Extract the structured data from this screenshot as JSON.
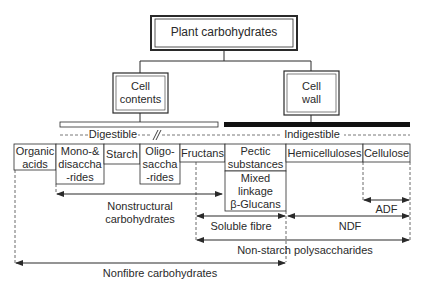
{
  "title": "Plant carbohydrates",
  "level2": {
    "cell_contents": [
      "Cell",
      "contents"
    ],
    "cell_wall": [
      "Cell",
      "wall"
    ]
  },
  "digestibility": {
    "digestible": "Digestible",
    "indigestible": "Indigestible"
  },
  "components": [
    {
      "id": "organic-acids",
      "lines": [
        "Organic",
        "acids"
      ]
    },
    {
      "id": "mono-disaccharides",
      "lines": [
        "Mono-&",
        "disaccha",
        "-rides"
      ]
    },
    {
      "id": "starch",
      "lines": [
        "Starch"
      ]
    },
    {
      "id": "oligosaccharides",
      "lines": [
        "Oligo-",
        "saccha",
        "-rides"
      ]
    },
    {
      "id": "fructans",
      "lines": [
        "Fructans"
      ]
    },
    {
      "id": "pectic-substances",
      "lines": [
        "Pectic",
        "substances"
      ]
    },
    {
      "id": "mixed-linkage-beta-glucans",
      "lines": [
        "Mixed",
        "linkage",
        "β-Glucans"
      ]
    },
    {
      "id": "hemicelluloses",
      "lines": [
        "Hemicelluloses"
      ]
    },
    {
      "id": "cellulose",
      "lines": [
        "Cellulose"
      ]
    }
  ],
  "groupings": {
    "nonstructural": [
      "Nonstructural",
      "carbohydrates"
    ],
    "adf": "ADF",
    "soluble_fibre": "Soluble fibre",
    "ndf": "NDF",
    "nsp": "Non-starch polysaccharides",
    "nonfibre": "Nonfibre carbohydrates"
  },
  "colors": {
    "line": "#2a2a2a",
    "background": "#ffffff"
  }
}
